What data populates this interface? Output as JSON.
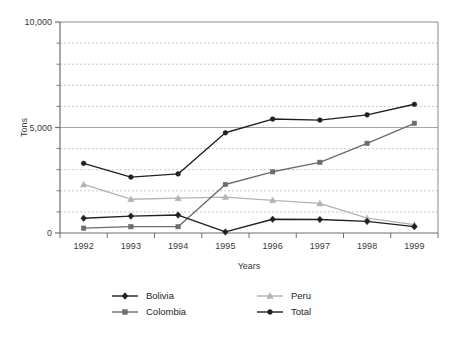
{
  "chart_data": {
    "type": "line",
    "title": "",
    "xlabel": "Years",
    "ylabel": "Tons",
    "categories": [
      "1992",
      "1993",
      "1994",
      "1995",
      "1996",
      "1997",
      "1998",
      "1999"
    ],
    "ylim": [
      0,
      10000
    ],
    "ytick_labels": [
      "0",
      "5,000",
      "10,000"
    ],
    "ytick_values": [
      0,
      5000,
      10000
    ],
    "minor_gridline_step": 1000,
    "grid": "horizontal-dashed",
    "legend_position": "bottom",
    "series": [
      {
        "name": "Bolivia",
        "marker": "diamond",
        "color": "#231f20",
        "values": [
          700,
          800,
          850,
          50,
          650,
          640,
          550,
          300
        ]
      },
      {
        "name": "Colombia",
        "marker": "square",
        "color": "#6d6d6d",
        "values": [
          230,
          300,
          300,
          2300,
          2900,
          3350,
          4250,
          5200
        ]
      },
      {
        "name": "Peru",
        "marker": "triangle",
        "color": "#b3b3b3",
        "values": [
          2300,
          1600,
          1650,
          1700,
          1550,
          1400,
          700,
          400
        ]
      },
      {
        "name": "Total",
        "marker": "circle",
        "color": "#231f20",
        "values": [
          3300,
          2650,
          2800,
          4750,
          5400,
          5350,
          5600,
          6100
        ]
      }
    ]
  },
  "legend": {
    "entries": [
      {
        "label": "Bolivia"
      },
      {
        "label": "Peru"
      },
      {
        "label": "Colombia"
      },
      {
        "label": "Total"
      }
    ]
  },
  "colors": {
    "bolivia": "#231f20",
    "colombia": "#6d6d6d",
    "peru": "#b3b3b3",
    "total": "#231f20",
    "grid": "#b9b9b9",
    "axis": "#6f6f6f",
    "frame": "#8a8a8a"
  }
}
